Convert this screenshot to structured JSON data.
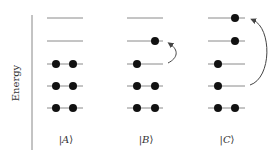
{
  "axis": {
    "label": "Energy",
    "color": "#888888"
  },
  "colors": {
    "level_line": "#8a8a8a",
    "electron": "#111111",
    "arrow": "#444444",
    "text": "#333333"
  },
  "levels_y": [
    18,
    41,
    64,
    86,
    108
  ],
  "states": [
    {
      "label": "|A⟩",
      "ket_open": "|",
      "ket_letter": "A",
      "ket_close": "⟩",
      "x_start": 47,
      "x_end": 83,
      "label_x": 66,
      "occupancy": [
        [],
        [],
        [
          56,
          73
        ],
        [
          56,
          73
        ],
        [
          56,
          73
        ]
      ],
      "excitation": null
    },
    {
      "label": "|B⟩",
      "ket_open": "|",
      "ket_letter": "B",
      "ket_close": "⟩",
      "x_start": 127,
      "x_end": 163,
      "label_x": 146,
      "occupancy": [
        [],
        [
          155
        ],
        [
          137
        ],
        [
          137,
          155
        ],
        [
          137,
          155
        ]
      ],
      "excitation": {
        "from_level": 2,
        "to_level": 1,
        "description": "single excitation"
      }
    },
    {
      "label": "|C⟩",
      "ket_open": "|",
      "ket_letter": "C",
      "ket_close": "⟩",
      "x_start": 208,
      "x_end": 245,
      "label_x": 227,
      "occupancy": [
        [
          235
        ],
        [
          235
        ],
        [
          218
        ],
        [
          218
        ],
        [
          218,
          235
        ]
      ],
      "excitation": {
        "from_level": 3,
        "to_level": 0,
        "description": "double excitation"
      }
    }
  ]
}
